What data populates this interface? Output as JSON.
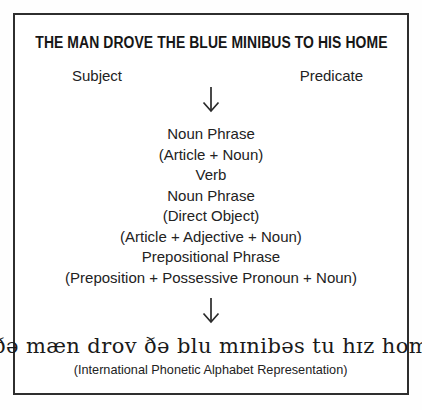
{
  "diagram": {
    "title": "THE MAN DROVE THE BLUE MINIBUS TO HIS HOME",
    "subject_label": "Subject",
    "predicate_label": "Predicate",
    "structure": [
      "Noun Phrase",
      "(Article + Noun)",
      "Verb",
      "Noun Phrase",
      "(Direct Object)",
      "(Article + Adjective + Noun)",
      "Prepositional Phrase",
      "(Preposition + Possessive Pronoun + Noun)"
    ],
    "ipa_transcription": "[ðə mæn drov ðə blu mɪnibəs tu hɪz hom]",
    "ipa_caption": "(International Phonetic Alphabet Representation)",
    "icons": {
      "down_arrow": "↓"
    },
    "colors": {
      "background": "#ffffff",
      "border": "#2e2e2e",
      "text": "#1b1b1b"
    }
  }
}
